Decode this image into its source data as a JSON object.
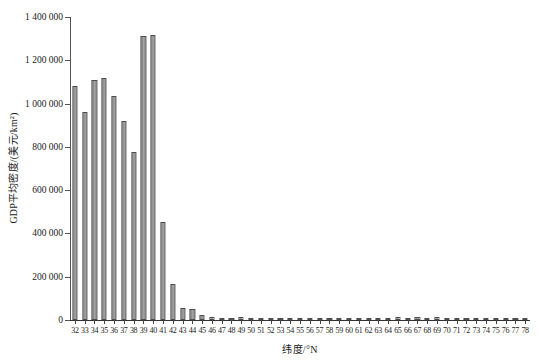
{
  "chart_data": {
    "type": "bar",
    "title": "",
    "subtitle": "",
    "xlabel": "纬度/°N",
    "ylabel": "GDP平均密度/(美元/km²)",
    "ylim": [
      0,
      1400000
    ],
    "ytick_labels": [
      "0",
      "200 000",
      "400 000",
      "600 000",
      "800 000",
      "1 000 000",
      "1 200 000",
      "1 400 000"
    ],
    "ytick_values": [
      0,
      200000,
      400000,
      600000,
      800000,
      1000000,
      1200000,
      1400000
    ],
    "grid": false,
    "legend": null,
    "bar_color": "#8f8f8f",
    "bar_edge_color": "#4d4d4d",
    "categories": [
      "32",
      "33",
      "34",
      "35",
      "36",
      "37",
      "38",
      "39",
      "40",
      "41",
      "42",
      "43",
      "44",
      "45",
      "46",
      "47",
      "48",
      "49",
      "50",
      "51",
      "52",
      "53",
      "54",
      "55",
      "56",
      "57",
      "58",
      "59",
      "60",
      "61",
      "62",
      "63",
      "64",
      "65",
      "66",
      "67",
      "68",
      "69",
      "70",
      "71",
      "72",
      "73",
      "74",
      "75",
      "76",
      "77",
      "78"
    ],
    "values": [
      1080000,
      960000,
      1110000,
      1120000,
      1035000,
      920000,
      775000,
      1310000,
      1315000,
      455000,
      165000,
      55000,
      50000,
      22000,
      14000,
      7000,
      5000,
      12000,
      11000,
      11000,
      11000,
      11000,
      11000,
      11000,
      11000,
      11000,
      10000,
      11000,
      11000,
      11000,
      10000,
      11000,
      10000,
      15000,
      10000,
      15000,
      10000,
      14000,
      10000,
      10000,
      10000,
      10000,
      11000,
      11000,
      11000,
      11000,
      11000
    ]
  },
  "axes": {
    "y_title": "GDP平均密度/(美元/km²)",
    "x_title": "纬度/°N"
  }
}
